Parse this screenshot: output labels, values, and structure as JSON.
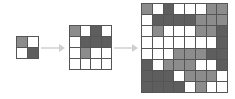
{
  "diagram": {
    "shade_levels": {
      "0": "#ffffff",
      "1": "#b5b5b5",
      "2": "#8c8c8c",
      "3": "#5e5e5e"
    },
    "grids": [
      {
        "name": "grid-2x2",
        "size": 2,
        "cells": [
          [
            2,
            0
          ],
          [
            0,
            3
          ]
        ]
      },
      {
        "name": "grid-4x4",
        "size": 4,
        "cells": [
          [
            2,
            0,
            3,
            0
          ],
          [
            0,
            3,
            3,
            3
          ],
          [
            0,
            2,
            0,
            0
          ],
          [
            0,
            0,
            0,
            0
          ]
        ]
      },
      {
        "name": "grid-8x8",
        "size": 8,
        "cells": [
          [
            2,
            0,
            3,
            0,
            0,
            0,
            2,
            2
          ],
          [
            0,
            3,
            3,
            3,
            3,
            2,
            2,
            2
          ],
          [
            0,
            2,
            0,
            0,
            0,
            2,
            2,
            3
          ],
          [
            0,
            0,
            0,
            0,
            0,
            0,
            0,
            3
          ],
          [
            0,
            0,
            0,
            2,
            2,
            2,
            3,
            3
          ],
          [
            3,
            0,
            2,
            2,
            2,
            0,
            0,
            3
          ],
          [
            3,
            3,
            3,
            0,
            2,
            2,
            2,
            0
          ],
          [
            3,
            3,
            3,
            3,
            0,
            2,
            0,
            0
          ]
        ]
      }
    ],
    "arrows": [
      {
        "from": "grid-2x2",
        "to": "grid-4x4"
      },
      {
        "from": "grid-4x4",
        "to": "grid-8x8"
      }
    ]
  }
}
